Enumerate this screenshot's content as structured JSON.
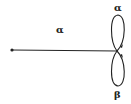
{
  "diagram": {
    "type": "graph-with-loops",
    "nodes": [
      {
        "id": "start",
        "x": 12,
        "y": 50,
        "kind": "dot"
      },
      {
        "id": "junction",
        "x": 117,
        "y": 51,
        "kind": "vertex"
      }
    ],
    "edges": [
      {
        "from": "start",
        "to": "junction",
        "label": "α"
      },
      {
        "from": "junction",
        "to": "junction",
        "label": "α",
        "position": "upper-loop"
      },
      {
        "from": "junction",
        "to": "junction",
        "label": "β",
        "position": "lower-loop"
      }
    ],
    "labels": {
      "line": "α",
      "upper_loop": "α",
      "lower_loop": "β"
    },
    "colors": {
      "stroke": "#222222",
      "background": "#ffffff"
    }
  }
}
